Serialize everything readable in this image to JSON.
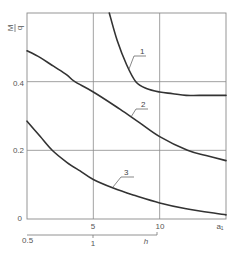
{
  "chart_data": {
    "type": "line",
    "title": "",
    "ylabel": "M/q",
    "ylabel_num": "M",
    "ylabel_den": "q",
    "xlabel": "a₁",
    "xlabel_secondary": "h",
    "xlim": [
      0,
      15
    ],
    "ylim": [
      0,
      0.6
    ],
    "grid": true,
    "x_ticks": [
      "5",
      "10"
    ],
    "x_tick_values": [
      5,
      10
    ],
    "y_ticks": [
      "0",
      "0.2",
      "0.4"
    ],
    "y_tick_values": [
      0,
      0.2,
      0.4
    ],
    "secondary_axis": {
      "label": "h",
      "ticks": [
        "0.5",
        "1"
      ],
      "tick_positions_on_primary": [
        0,
        5
      ],
      "end_on_primary": 10
    },
    "series": [
      {
        "name": "1",
        "x": [
          6.2,
          6.8,
          7.5,
          8.2,
          9.0,
          10,
          11,
          12,
          13,
          15
        ],
        "y": [
          0.6,
          0.52,
          0.45,
          0.4,
          0.38,
          0.37,
          0.365,
          0.36,
          0.36,
          0.36
        ]
      },
      {
        "name": "2",
        "x": [
          0,
          1,
          2,
          3,
          3.6,
          5,
          7,
          8.5,
          10,
          12.1,
          13.5,
          15
        ],
        "y": [
          0.49,
          0.47,
          0.445,
          0.42,
          0.4,
          0.37,
          0.32,
          0.28,
          0.24,
          0.2,
          0.185,
          0.17
        ]
      },
      {
        "name": "3",
        "x": [
          0,
          1,
          1.9,
          3,
          4,
          5,
          6.5,
          8,
          10,
          12,
          15
        ],
        "y": [
          0.285,
          0.24,
          0.2,
          0.165,
          0.14,
          0.115,
          0.09,
          0.07,
          0.047,
          0.03,
          0.012
        ]
      }
    ],
    "curve_labels": [
      {
        "text": "1",
        "series": "1"
      },
      {
        "text": "2",
        "series": "2"
      },
      {
        "text": "3",
        "series": "3"
      }
    ]
  }
}
